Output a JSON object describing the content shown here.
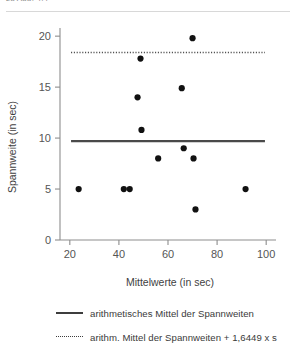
{
  "top_caption": "zu Abb. 4.4",
  "chart_data": {
    "type": "scatter",
    "title": "",
    "xlabel": "Mittelwerte (in sec)",
    "ylabel": "Spannweite (in sec)",
    "xlim": [
      16,
      104
    ],
    "ylim": [
      0,
      20.8
    ],
    "xticks": [
      20,
      40,
      60,
      80,
      100
    ],
    "yticks": [
      0,
      5,
      10,
      15,
      20
    ],
    "xticklabels": [
      "20",
      "40",
      "60",
      "80",
      "100"
    ],
    "yticklabels": [
      "0",
      "5",
      "10",
      "15",
      "20"
    ],
    "grid": false,
    "legend_position": "below",
    "points": [
      {
        "x": 23.6,
        "y": 5.0
      },
      {
        "x": 42.0,
        "y": 5.0
      },
      {
        "x": 44.4,
        "y": 5.0
      },
      {
        "x": 47.6,
        "y": 14.0
      },
      {
        "x": 48.8,
        "y": 17.8
      },
      {
        "x": 49.2,
        "y": 10.8
      },
      {
        "x": 56.0,
        "y": 8.0
      },
      {
        "x": 65.6,
        "y": 14.9
      },
      {
        "x": 66.4,
        "y": 9.0
      },
      {
        "x": 70.0,
        "y": 19.8
      },
      {
        "x": 70.4,
        "y": 8.0
      },
      {
        "x": 71.2,
        "y": 3.0
      },
      {
        "x": 91.6,
        "y": 5.0
      }
    ],
    "reference_lines": [
      {
        "name": "mean",
        "value": 9.7,
        "style": "solid",
        "label": "arithmetisches Mittel der Spannweiten",
        "color": "#3d3d3d",
        "x_start": 20.5,
        "x_end": 99.5
      },
      {
        "name": "mean_plus_1_6449s",
        "value": 18.4,
        "style": "dotted",
        "label": "arithm. Mittel der Spannweiten + 1,6449 x s",
        "color": "#3d3d3d",
        "x_start": 20.5,
        "x_end": 99.5
      }
    ]
  },
  "legend": {
    "mean_label": "arithmetisches Mittel der Spannweiten",
    "upper_label": "arithm. Mittel der Spannweiten + 1,6449 x s"
  }
}
